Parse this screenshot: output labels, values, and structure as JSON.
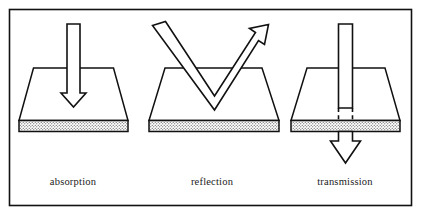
{
  "figure": {
    "border_color": "#111111",
    "line_color": "#111111",
    "fill_color": "#ffffff",
    "substrate_pattern": "stippled-dots"
  },
  "panels": [
    {
      "id": "absorption",
      "label": "absorption",
      "phenomenon": "beam enters material and terminates inside it",
      "arrow_kind": "straight-down-arrow",
      "arrow_direction": "down",
      "label_x": 73,
      "label_y": 182
    },
    {
      "id": "reflection",
      "label": "reflection",
      "phenomenon": "beam strikes surface and bounces back upward",
      "arrow_kind": "v-shaped-bounce-arrow",
      "arrow_direction": "down-then-up",
      "label_x": 212,
      "label_y": 182
    },
    {
      "id": "transmission",
      "label": "transmission",
      "phenomenon": "beam passes through material and exits below",
      "arrow_kind": "through-beam-with-exit-arrow",
      "arrow_direction": "down-through",
      "label_x": 345,
      "label_y": 182
    }
  ]
}
